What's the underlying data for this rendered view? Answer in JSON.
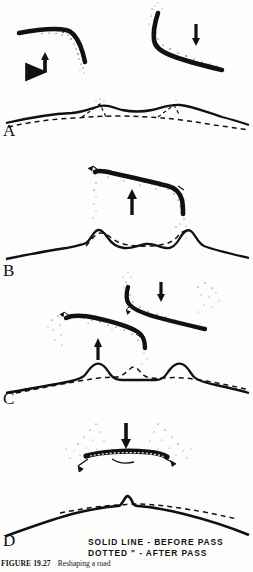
{
  "figure": {
    "number_label": "FIGURE 19.27",
    "caption_text": "Reshaping a road",
    "ink_color": "#111111",
    "paper_color": "#fdfdfb"
  },
  "legend": {
    "line1": "SOLID LINE - BEFORE PASS",
    "line2": "DOTTED \" - AFTER PASS"
  },
  "stages": [
    {
      "id": "A",
      "label": "A",
      "blade_count": 2,
      "arrows": [
        "up",
        "down"
      ],
      "profile_description": "rough road surface with two soil windrows"
    },
    {
      "id": "B",
      "label": "B",
      "blade_count": 1,
      "arrows": [
        "up"
      ],
      "profile_description": "two ridges with shallow center crown"
    },
    {
      "id": "C",
      "label": "C",
      "blade_count": 2,
      "arrows": [
        "up",
        "down"
      ],
      "profile_description": "two shoulder ridges with small center peak"
    },
    {
      "id": "D",
      "label": "D",
      "blade_count": 1,
      "arrows": [
        "down"
      ],
      "profile_description": "finished crowned road surface"
    }
  ]
}
